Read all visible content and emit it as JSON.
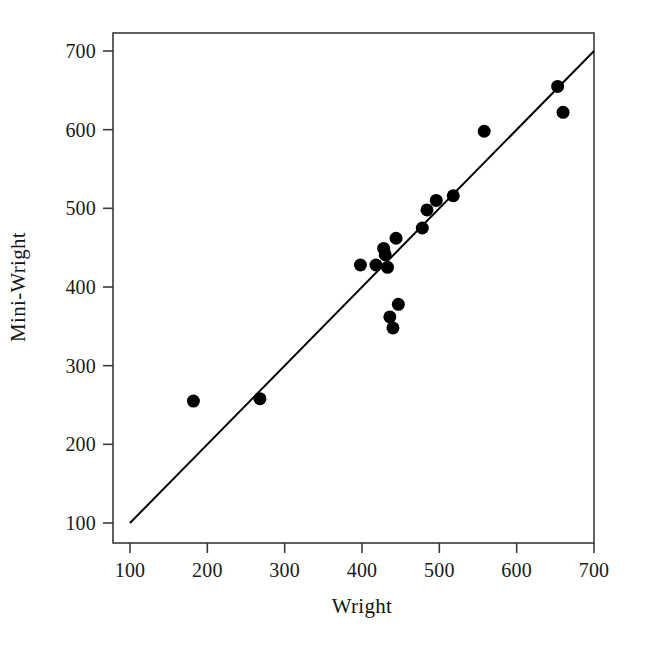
{
  "chart_data": {
    "type": "scatter",
    "title": "",
    "xlabel": "Wright",
    "ylabel": "Mini-Wright",
    "xlim": [
      100,
      700
    ],
    "ylim": [
      100,
      700
    ],
    "xticks": [
      100,
      200,
      300,
      400,
      500,
      600,
      700
    ],
    "yticks": [
      100,
      200,
      300,
      400,
      500,
      600,
      700
    ],
    "xtick_labels": [
      "100",
      "200",
      "300",
      "400",
      "500",
      "600",
      "700"
    ],
    "ytick_labels": [
      "100",
      "200",
      "300",
      "400",
      "500",
      "600",
      "700"
    ],
    "grid": false,
    "legend": null,
    "marker": {
      "shape": "circle",
      "filled": true,
      "color": "#000000",
      "size_px": 13
    },
    "points": [
      {
        "x": 182,
        "y": 255
      },
      {
        "x": 268,
        "y": 258
      },
      {
        "x": 398,
        "y": 428
      },
      {
        "x": 418,
        "y": 428
      },
      {
        "x": 428,
        "y": 449
      },
      {
        "x": 430,
        "y": 441
      },
      {
        "x": 433,
        "y": 425
      },
      {
        "x": 436,
        "y": 362
      },
      {
        "x": 440,
        "y": 348
      },
      {
        "x": 447,
        "y": 378
      },
      {
        "x": 444,
        "y": 462
      },
      {
        "x": 478,
        "y": 475
      },
      {
        "x": 484,
        "y": 498
      },
      {
        "x": 496,
        "y": 510
      },
      {
        "x": 518,
        "y": 516
      },
      {
        "x": 558,
        "y": 598
      },
      {
        "x": 653,
        "y": 655
      },
      {
        "x": 660,
        "y": 622
      }
    ],
    "reference_line": {
      "name": "identity-line",
      "description": "y = x line of equality",
      "slope": 1,
      "intercept": 0,
      "from": {
        "x": 100,
        "y": 100
      },
      "to": {
        "x": 700,
        "y": 700
      },
      "color": "#000000",
      "width_px": 2
    },
    "axes_frame": {
      "color": "#333333",
      "spines": [
        "left",
        "bottom",
        "top",
        "right"
      ]
    }
  }
}
